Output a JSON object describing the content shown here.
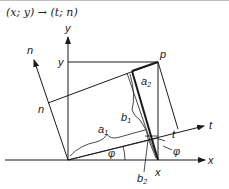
{
  "title": "(x; y) → (t; n)",
  "diagram": {
    "axes": {
      "x_label": "x",
      "y_label": "y",
      "t_label": "t",
      "n_label": "n"
    },
    "point_label": "p",
    "projection_labels": {
      "x": "x",
      "y": "y",
      "t": "t",
      "n": "n"
    },
    "segment_labels": {
      "a1": {
        "base": "a",
        "sub": "1"
      },
      "a2": {
        "base": "a",
        "sub": "2"
      },
      "b1": {
        "base": "b",
        "sub": "1"
      },
      "b2": {
        "base": "b",
        "sub": "2"
      }
    },
    "angle_label": "φ",
    "angle_label_2": "φ"
  }
}
